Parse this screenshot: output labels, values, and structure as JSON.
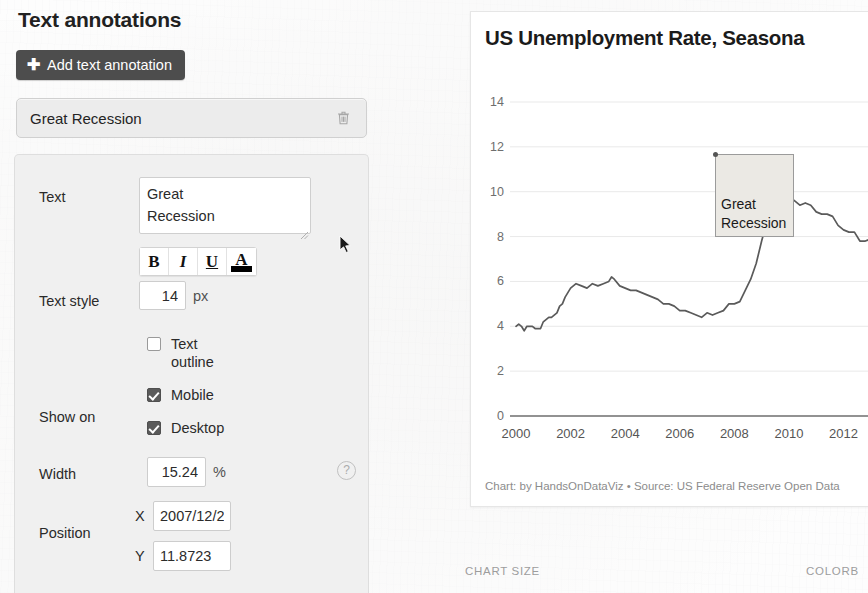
{
  "panel": {
    "heading": "Text annotations",
    "add_button": {
      "label": "Add text annotation",
      "icon": "plus-icon"
    },
    "annotations": [
      {
        "label": "Great Recession",
        "delete_icon": "trash-icon"
      }
    ]
  },
  "form": {
    "text": {
      "label": "Text",
      "value": "Great\nRecession"
    },
    "text_style": {
      "label": "Text style",
      "buttons": [
        {
          "name": "bold",
          "glyph": "B"
        },
        {
          "name": "italic",
          "glyph": "I"
        },
        {
          "name": "underline",
          "glyph": "U"
        },
        {
          "name": "text-color",
          "glyph": "A",
          "swatch_color": "#000000"
        }
      ],
      "font_size": "14",
      "font_size_unit": "px"
    },
    "text_outline": {
      "label": "Text\noutline",
      "checked": false
    },
    "show_on": {
      "label": "Show on",
      "options": [
        {
          "label": "Mobile",
          "checked": true
        },
        {
          "label": "Desktop",
          "checked": true
        }
      ]
    },
    "width": {
      "label": "Width",
      "value": "15.24",
      "unit": "%",
      "help_icon": "question-mark-icon"
    },
    "position": {
      "label": "Position",
      "x_letter": "X",
      "x_value": "2007/12/2",
      "y_letter": "Y",
      "y_value": "11.8723"
    }
  },
  "chart_panel": {
    "title": "US Unemployment Rate, Seasona",
    "caption": "Chart: by HandsOnDataViz • Source: US Federal Reserve Open Data",
    "overlay_annotation": "Great\nRecession"
  },
  "bottom_bar": {
    "chart_size_label": "CHART SIZE",
    "colorblind_label": "COLORB"
  },
  "chart_data": {
    "type": "line",
    "title": "US Unemployment Rate, Seasona",
    "xlabel": "",
    "ylabel": "",
    "xlim": [
      2000,
      2013.3
    ],
    "ylim": [
      0,
      14
    ],
    "grid": true,
    "legend": "none",
    "line_color": "#5a5a5a",
    "y_ticks": [
      0,
      2,
      4,
      6,
      8,
      10,
      12,
      14
    ],
    "x_ticks": [
      2000,
      2002,
      2004,
      2006,
      2008,
      2010,
      2012
    ],
    "annotations": [
      {
        "text": "Great\nRecession",
        "x": "2007/12/2",
        "y": 11.8723
      }
    ],
    "series": [
      {
        "name": "US Unemployment Rate",
        "x": [
          2000.0,
          2000.1,
          2000.2,
          2000.3,
          2000.4,
          2000.5,
          2000.6,
          2000.7,
          2000.8,
          2000.9,
          2001.0,
          2001.1,
          2001.2,
          2001.3,
          2001.4,
          2001.5,
          2001.6,
          2001.7,
          2001.8,
          2001.9,
          2002.0,
          2002.2,
          2002.4,
          2002.6,
          2002.8,
          2003.0,
          2003.2,
          2003.4,
          2003.5,
          2003.6,
          2003.8,
          2004.0,
          2004.2,
          2004.4,
          2004.6,
          2004.8,
          2005.0,
          2005.2,
          2005.4,
          2005.6,
          2005.8,
          2006.0,
          2006.2,
          2006.4,
          2006.6,
          2006.8,
          2007.0,
          2007.2,
          2007.4,
          2007.6,
          2007.8,
          2008.0,
          2008.2,
          2008.4,
          2008.6,
          2008.8,
          2009.0,
          2009.2,
          2009.4,
          2009.6,
          2009.8,
          2010.0,
          2010.2,
          2010.4,
          2010.6,
          2010.8,
          2011.0,
          2011.2,
          2011.4,
          2011.6,
          2011.8,
          2012.0,
          2012.2,
          2012.4,
          2012.6,
          2012.8,
          2013.0,
          2013.2
        ],
        "y": [
          4.0,
          4.1,
          4.0,
          3.8,
          4.0,
          4.0,
          4.0,
          3.9,
          3.9,
          3.9,
          4.2,
          4.3,
          4.4,
          4.4,
          4.5,
          4.6,
          4.9,
          5.0,
          5.3,
          5.5,
          5.7,
          5.9,
          5.8,
          5.7,
          5.9,
          5.8,
          5.9,
          6.0,
          6.2,
          6.1,
          5.8,
          5.7,
          5.6,
          5.6,
          5.5,
          5.4,
          5.3,
          5.2,
          5.0,
          5.0,
          4.9,
          4.7,
          4.7,
          4.6,
          4.5,
          4.4,
          4.6,
          4.5,
          4.6,
          4.7,
          5.0,
          5.0,
          5.1,
          5.6,
          6.1,
          6.8,
          7.8,
          8.7,
          9.5,
          9.6,
          9.9,
          9.8,
          9.6,
          9.4,
          9.5,
          9.4,
          9.1,
          9.0,
          9.0,
          8.9,
          8.5,
          8.3,
          8.2,
          8.2,
          7.8,
          7.8,
          7.9,
          7.6
        ]
      }
    ]
  }
}
